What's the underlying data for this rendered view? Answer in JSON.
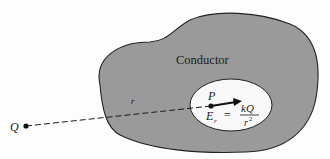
{
  "diagram": {
    "conductor_label": "Conductor",
    "charge_label": "Q",
    "distance_label": "r",
    "point_label": "P",
    "field_label": "E",
    "field_subscript": "r",
    "equals": "=",
    "numerator": "kQ",
    "denominator": "r",
    "denominator_exp": "2"
  },
  "colors": {
    "conductor_fill": "#9a9a9a",
    "cavity_fill": "#f8f8f8",
    "outline": "#222222",
    "background": "#fdfdfd"
  }
}
